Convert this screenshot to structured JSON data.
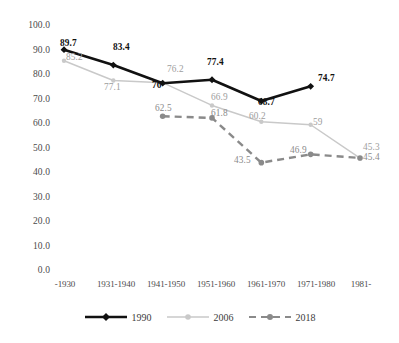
{
  "chart_data": {
    "type": "line",
    "title": "",
    "xlabel": "",
    "ylabel": "",
    "ylim": [
      0,
      100
    ],
    "ytick_step": 10,
    "grid": false,
    "legend_position": "bottom",
    "categories": [
      "-1930",
      "1931-1940",
      "1941-1950",
      "1951-1960",
      "1961-1970",
      "1971-1980",
      "1981-"
    ],
    "ytick_labels": [
      "100.0",
      "90.0",
      "80.0",
      "70.0",
      "60.0",
      "50.0",
      "40.0",
      "30.0",
      "20.0",
      "10.0",
      "0.0"
    ],
    "series": [
      {
        "name": "1990",
        "color": "#111111",
        "style": "solid",
        "marker": "diamond",
        "values": [
          89.7,
          83.4,
          76,
          77.4,
          68.7,
          74.7,
          null
        ],
        "labels": [
          "89.7",
          "83.4",
          "76",
          "77.4",
          "68.7",
          "74.7",
          ""
        ]
      },
      {
        "name": "2006",
        "color": "#c9c9c9",
        "style": "solid",
        "marker": "circle",
        "values": [
          85.2,
          77.1,
          76.2,
          66.9,
          60.2,
          59,
          45.3
        ],
        "labels": [
          "85.2",
          "77.1",
          "76.2",
          "66.9",
          "60.2",
          "59",
          "45.3"
        ]
      },
      {
        "name": "2018",
        "color": "#8a8a8a",
        "style": "dashed",
        "marker": "circle",
        "values": [
          null,
          null,
          62.5,
          61.8,
          43.5,
          46.9,
          45.4
        ],
        "labels": [
          "",
          "",
          "62.5",
          "61.8",
          "43.5",
          "46.9",
          "45.4"
        ]
      }
    ]
  },
  "legend": {
    "items": [
      {
        "label": "1990"
      },
      {
        "label": "2006"
      },
      {
        "label": "2018"
      }
    ]
  }
}
